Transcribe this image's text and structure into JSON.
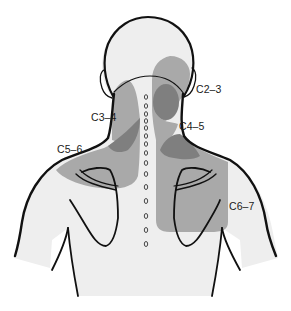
{
  "figure": {
    "colors": {
      "background": "#ffffff",
      "skin": "#eeeeee",
      "outline": "#111111",
      "zone_light": "#a9a9a9",
      "zone_dark": "#7f7f7f"
    }
  },
  "labels": [
    {
      "id": "c2-3",
      "text": "C2–3",
      "x": 196,
      "y": 84
    },
    {
      "id": "c3-4",
      "text": "C3–4",
      "x": 91,
      "y": 112
    },
    {
      "id": "c4-5",
      "text": "C4–5",
      "x": 179,
      "y": 121
    },
    {
      "id": "c5-6",
      "text": "C5–6",
      "x": 57,
      "y": 144
    },
    {
      "id": "c6-7",
      "text": "C6–7",
      "x": 229,
      "y": 201
    }
  ],
  "zones": [
    {
      "id": "c2-3",
      "label": "C2–3",
      "shade": "dark"
    },
    {
      "id": "c3-4",
      "label": "C3–4",
      "shade": "light"
    },
    {
      "id": "c4-5",
      "label": "C4–5",
      "shade": "dark"
    },
    {
      "id": "c5-6",
      "label": "C5–6",
      "shade": "light"
    },
    {
      "id": "c6-7",
      "label": "C6–7",
      "shade": "light"
    }
  ],
  "spine": {
    "marker": "o",
    "count": 16
  }
}
